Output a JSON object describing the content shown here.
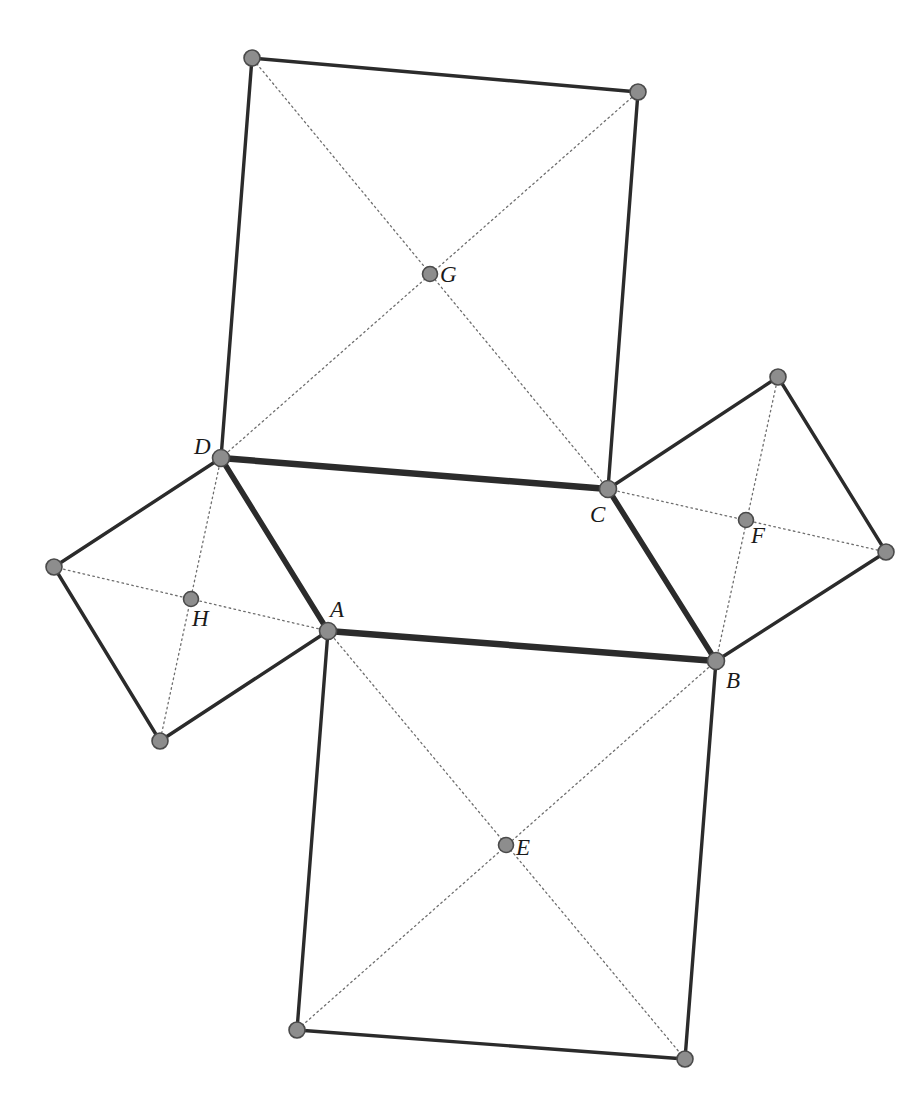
{
  "figure": {
    "background_color": "#ffffff",
    "stroke_color": "#2b2b2b",
    "dot_fill_color": "#8d8d8d",
    "dot_stroke_color": "#4a4a4a",
    "dotted_color": "#6e6e6e",
    "label_color": "#1a1a1a",
    "width": 923,
    "height": 1101
  },
  "points": {
    "A": {
      "label": "A",
      "x": 328,
      "y": 631,
      "label_x": 330,
      "label_y": 598,
      "kind": "parallelogram-vertex"
    },
    "B": {
      "label": "B",
      "x": 716,
      "y": 661,
      "label_x": 726,
      "label_y": 669,
      "kind": "parallelogram-vertex"
    },
    "C": {
      "label": "C",
      "x": 608,
      "y": 489,
      "label_x": 590,
      "label_y": 503,
      "kind": "parallelogram-vertex"
    },
    "D": {
      "label": "D",
      "x": 221,
      "y": 458,
      "label_x": 194,
      "label_y": 435,
      "kind": "parallelogram-vertex"
    },
    "E": {
      "label": "E",
      "x": 506,
      "y": 845,
      "label_x": 516,
      "label_y": 836,
      "kind": "square-center"
    },
    "F": {
      "label": "F",
      "x": 746,
      "y": 520,
      "label_x": 751,
      "label_y": 524,
      "kind": "square-center"
    },
    "G": {
      "label": "G",
      "x": 430,
      "y": 274,
      "label_x": 440,
      "label_y": 263,
      "kind": "square-center"
    },
    "H": {
      "label": "H",
      "x": 191,
      "y": 599,
      "label_x": 192,
      "label_y": 607,
      "kind": "square-center"
    },
    "P1": {
      "label": "",
      "x": 297,
      "y": 1030,
      "label_x": 0,
      "label_y": 0,
      "kind": "square-corner"
    },
    "P2": {
      "label": "",
      "x": 685,
      "y": 1059,
      "label_x": 0,
      "label_y": 0,
      "kind": "square-corner"
    },
    "P3": {
      "label": "",
      "x": 886,
      "y": 552,
      "label_x": 0,
      "label_y": 0,
      "kind": "square-corner"
    },
    "P4": {
      "label": "",
      "x": 778,
      "y": 377,
      "label_x": 0,
      "label_y": 0,
      "kind": "square-corner"
    },
    "P5": {
      "label": "",
      "x": 638,
      "y": 92,
      "label_x": 0,
      "label_y": 0,
      "kind": "square-corner"
    },
    "P6": {
      "label": "",
      "x": 252,
      "y": 58,
      "label_x": 0,
      "label_y": 0,
      "kind": "square-corner"
    },
    "P7": {
      "label": "",
      "x": 54,
      "y": 567,
      "label_x": 0,
      "label_y": 0,
      "kind": "square-corner"
    },
    "P8": {
      "label": "",
      "x": 160,
      "y": 741,
      "label_x": 0,
      "label_y": 0,
      "kind": "square-corner"
    }
  },
  "edges": {
    "parallelogram": [
      {
        "name": "edge-AB",
        "from": "A",
        "to": "B",
        "width": 6.5
      },
      {
        "name": "edge-BC",
        "from": "B",
        "to": "C",
        "width": 5.5
      },
      {
        "name": "edge-CD",
        "from": "C",
        "to": "D",
        "width": 6.5
      },
      {
        "name": "edge-DA",
        "from": "D",
        "to": "A",
        "width": 5.5
      }
    ],
    "square_sides": [
      {
        "name": "square-ab-side-b-p2",
        "from": "B",
        "to": "P2",
        "width": 3.4
      },
      {
        "name": "square-ab-side-p2-p1",
        "from": "P2",
        "to": "P1",
        "width": 3.4
      },
      {
        "name": "square-ab-side-p1-a",
        "from": "P1",
        "to": "A",
        "width": 3.4
      },
      {
        "name": "square-bc-side-c-p4",
        "from": "C",
        "to": "P4",
        "width": 3.4
      },
      {
        "name": "square-bc-side-p4-p3",
        "from": "P4",
        "to": "P3",
        "width": 3.4
      },
      {
        "name": "square-bc-side-p3-b",
        "from": "P3",
        "to": "B",
        "width": 3.4
      },
      {
        "name": "square-cd-side-d-p6",
        "from": "D",
        "to": "P6",
        "width": 3.4
      },
      {
        "name": "square-cd-side-p6-p5",
        "from": "P6",
        "to": "P5",
        "width": 3.4
      },
      {
        "name": "square-cd-side-p5-c",
        "from": "P5",
        "to": "C",
        "width": 3.4
      },
      {
        "name": "square-da-side-a-p8",
        "from": "A",
        "to": "P8",
        "width": 3.4
      },
      {
        "name": "square-da-side-p8-p7",
        "from": "P8",
        "to": "P7",
        "width": 3.4
      },
      {
        "name": "square-da-side-p7-d",
        "from": "P7",
        "to": "D",
        "width": 3.4
      }
    ],
    "diagonals_dotted": [
      {
        "name": "diagonal-ab-a-p2",
        "from": "A",
        "to": "P2",
        "width": 1.3
      },
      {
        "name": "diagonal-ab-b-p1",
        "from": "B",
        "to": "P1",
        "width": 1.3
      },
      {
        "name": "diagonal-bc-b-p4",
        "from": "B",
        "to": "P4",
        "width": 1.3
      },
      {
        "name": "diagonal-bc-c-p3",
        "from": "C",
        "to": "P3",
        "width": 1.3
      },
      {
        "name": "diagonal-cd-c-p6",
        "from": "C",
        "to": "P6",
        "width": 1.3
      },
      {
        "name": "diagonal-cd-d-p5",
        "from": "D",
        "to": "P5",
        "width": 1.3
      },
      {
        "name": "diagonal-da-d-p8",
        "from": "D",
        "to": "P8",
        "width": 1.3
      },
      {
        "name": "diagonal-da-a-p7",
        "from": "A",
        "to": "P7",
        "width": 1.3
      }
    ]
  },
  "dot_radius": {
    "parallelogram-vertex": 8.5,
    "square-center": 7.5,
    "square-corner": 8.0
  }
}
